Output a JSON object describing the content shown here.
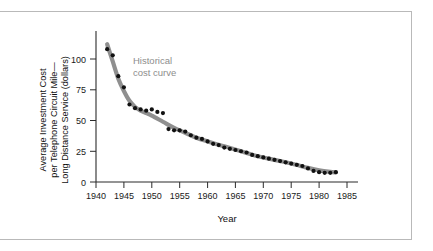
{
  "figure": {
    "background_color": "#ffffff",
    "frame_color": "#b9b9b9"
  },
  "chart_data": {
    "type": "scatter",
    "title": "",
    "subtitle": "",
    "xlabel": "Year",
    "ylabel": "Average Investment Cost per Telephone Circuit Mile—Long Distance Service (dollars)",
    "ylabel_lines": [
      "Average Investment Cost",
      "per Telephone Circuit Mile—",
      "Long Distance Service (dollars)"
    ],
    "xlim": [
      1939,
      1987
    ],
    "ylim": [
      0,
      118
    ],
    "xticks": [
      1940,
      1945,
      1950,
      1955,
      1960,
      1965,
      1970,
      1975,
      1980,
      1985
    ],
    "xtick_labels": [
      "1940",
      "1945",
      "1950",
      "1955",
      "1960",
      "1965",
      "1970",
      "1975",
      "1980",
      "1985"
    ],
    "yticks": [
      0,
      25,
      50,
      75,
      100
    ],
    "ytick_labels": [
      "0",
      "25",
      "50",
      "75",
      "100"
    ],
    "grid": false,
    "legend_position": "none",
    "annotations": [
      {
        "text": "Historical cost curve",
        "lines": [
          "Historical",
          "cost curve"
        ],
        "x": 1953,
        "y": 86,
        "color": "#8d8d8d"
      }
    ],
    "series": [
      {
        "name": "Historical cost curve",
        "type": "line",
        "color": "#8f8f8f",
        "linewidth": 4.2,
        "x": [
          1942,
          1943,
          1944,
          1945,
          1946,
          1947,
          1948,
          1949,
          1950,
          1952,
          1954,
          1956,
          1958,
          1960,
          1963,
          1966,
          1969,
          1972,
          1975,
          1978,
          1980,
          1982,
          1983
        ],
        "values": [
          112,
          98,
          84,
          74,
          66,
          61,
          58,
          56,
          54,
          49,
          44,
          40,
          36,
          33,
          29,
          25,
          21,
          18,
          15,
          11.5,
          9.5,
          8.2,
          7.8
        ]
      },
      {
        "name": "Observed annual cost",
        "type": "scatter",
        "color": "#111111",
        "marker": "circle",
        "x": [
          1942,
          1943,
          1944,
          1945,
          1946,
          1947,
          1948,
          1949,
          1950,
          1951,
          1952,
          1953,
          1954,
          1955,
          1956,
          1957,
          1958,
          1959,
          1960,
          1961,
          1962,
          1963,
          1964,
          1965,
          1966,
          1967,
          1968,
          1969,
          1970,
          1971,
          1972,
          1973,
          1974,
          1975,
          1976,
          1977,
          1978,
          1979,
          1980,
          1981,
          1982,
          1983
        ],
        "values": [
          108,
          103,
          86,
          77,
          63,
          60,
          59,
          58,
          59,
          57,
          56,
          43,
          42,
          42,
          41,
          38,
          36,
          35,
          33,
          31,
          30,
          28,
          27,
          26,
          25,
          24,
          22,
          21,
          20,
          19,
          18,
          17,
          16,
          15,
          14,
          13,
          11,
          9,
          8,
          7.5,
          7.5,
          8
        ]
      }
    ]
  }
}
